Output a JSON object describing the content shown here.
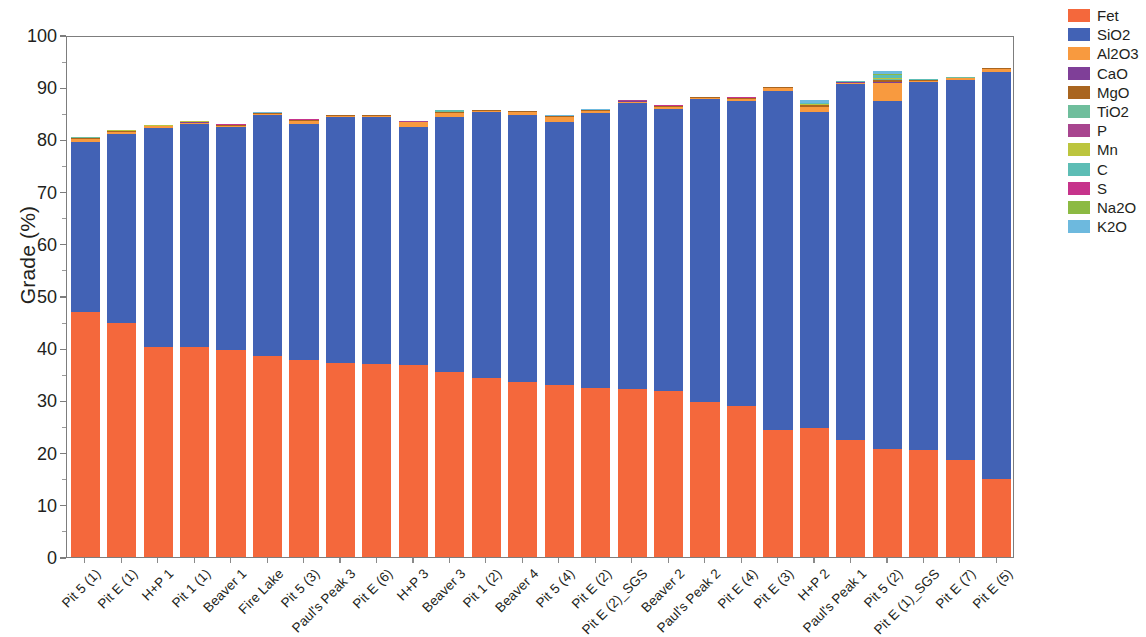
{
  "chart_data": {
    "type": "bar",
    "subtype": "stacked-bar",
    "title": "",
    "xlabel": "",
    "ylabel": "Grade (%)",
    "ylim": [
      0,
      100
    ],
    "ytick_step": 10,
    "yticks": [
      "0",
      "10",
      "20",
      "30",
      "40",
      "50",
      "60",
      "70",
      "80",
      "90",
      "100"
    ],
    "grid": false,
    "legend_position": "right",
    "categories": [
      "Pit 5 (1)",
      "Pit E (1)",
      "H+P 1",
      "Pit 1 (1)",
      "Beaver 1",
      "Fire Lake",
      "Pit 5 (3)",
      "Paul's Peak 3",
      "Pit E (6)",
      "H+P 3",
      "Beaver 3",
      "Pit 1 (2)",
      "Beaver 4",
      "Pit 5 (4)",
      "Pit E (2)",
      "Pit E (2)_SGS",
      "Beaver 2",
      "Paul's Peak 2",
      "Pit E (4)",
      "Pit E (3)",
      "H+P 2",
      "Paul's Peak 1",
      "Pit 5 (2)",
      "Pit E (1)_SGS",
      "Pit E (7)",
      "Pit E (5)"
    ],
    "series": [
      {
        "name": "Fet",
        "color": "#F4683C",
        "values": [
          46.9,
          44.8,
          40.2,
          40.2,
          39.6,
          38.6,
          37.7,
          37.2,
          37.0,
          36.8,
          35.4,
          34.2,
          33.6,
          33.0,
          32.4,
          32.2,
          31.8,
          29.7,
          28.9,
          24.4,
          24.7,
          22.4,
          20.7,
          20.5,
          18.6,
          14.9
        ]
      },
      {
        "name": "SiO2",
        "color": "#4262B5",
        "values": [
          32.6,
          36.2,
          42.0,
          42.8,
          42.8,
          46.1,
          45.2,
          47.1,
          47.3,
          45.6,
          48.8,
          51.0,
          51.0,
          50.4,
          52.7,
          54.7,
          54.0,
          58.0,
          58.5,
          64.9,
          60.6,
          68.3,
          66.6,
          70.5,
          72.7,
          78.1
        ]
      },
      {
        "name": "Al2O3",
        "color": "#F89A3F",
        "values": [
          0.55,
          0.4,
          0.28,
          0.22,
          0.22,
          0.2,
          0.65,
          0.18,
          0.2,
          0.86,
          0.8,
          0.22,
          0.6,
          0.9,
          0.35,
          0.35,
          0.45,
          0.25,
          0.4,
          0.55,
          0.9,
          0.2,
          3.6,
          0.25,
          0.4,
          0.45
        ]
      },
      {
        "name": "CaO",
        "color": "#7F3F98",
        "values": [
          0.03,
          0.03,
          0.03,
          0.03,
          0.03,
          0.03,
          0.03,
          0.03,
          0.03,
          0.03,
          0.03,
          0.03,
          0.03,
          0.03,
          0.03,
          0.03,
          0.03,
          0.03,
          0.03,
          0.03,
          0.03,
          0.03,
          0.05,
          0.03,
          0.03,
          0.03
        ]
      },
      {
        "name": "MgO",
        "color": "#A9651F",
        "values": [
          0.28,
          0.22,
          0.12,
          0.12,
          0.12,
          0.1,
          0.15,
          0.1,
          0.1,
          0.12,
          0.2,
          0.1,
          0.12,
          0.12,
          0.12,
          0.15,
          0.12,
          0.1,
          0.12,
          0.12,
          0.3,
          0.1,
          0.35,
          0.12,
          0.12,
          0.12
        ]
      },
      {
        "name": "TiO2",
        "color": "#6FBE9C",
        "values": [
          0.02,
          0.02,
          0.02,
          0.02,
          0.02,
          0.02,
          0.02,
          0.02,
          0.02,
          0.02,
          0.25,
          0.02,
          0.02,
          0.02,
          0.02,
          0.02,
          0.02,
          0.02,
          0.02,
          0.02,
          0.12,
          0.02,
          0.3,
          0.02,
          0.02,
          0.02
        ]
      },
      {
        "name": "P",
        "color": "#A8458F",
        "values": [
          0.02,
          0.02,
          0.02,
          0.02,
          0.02,
          0.02,
          0.02,
          0.02,
          0.02,
          0.02,
          0.02,
          0.02,
          0.02,
          0.02,
          0.02,
          0.02,
          0.02,
          0.02,
          0.02,
          0.02,
          0.02,
          0.02,
          0.03,
          0.02,
          0.02,
          0.02
        ]
      },
      {
        "name": "Mn",
        "color": "#BCC53E",
        "values": [
          0.04,
          0.04,
          0.03,
          0.03,
          0.03,
          0.03,
          0.03,
          0.03,
          0.03,
          0.03,
          0.03,
          0.03,
          0.03,
          0.03,
          0.03,
          0.03,
          0.03,
          0.03,
          0.03,
          0.03,
          0.12,
          0.03,
          0.2,
          0.03,
          0.03,
          0.03
        ]
      },
      {
        "name": "C",
        "color": "#5DBDB5",
        "values": [
          0.03,
          0.03,
          0.02,
          0.02,
          0.02,
          0.02,
          0.02,
          0.02,
          0.02,
          0.02,
          0.02,
          0.02,
          0.02,
          0.02,
          0.02,
          0.02,
          0.02,
          0.02,
          0.02,
          0.02,
          0.25,
          0.02,
          0.55,
          0.02,
          0.02,
          0.02
        ]
      },
      {
        "name": "S",
        "color": "#C6338B",
        "values": [
          0.02,
          0.02,
          0.02,
          0.02,
          0.02,
          0.02,
          0.02,
          0.02,
          0.02,
          0.02,
          0.02,
          0.02,
          0.02,
          0.02,
          0.02,
          0.02,
          0.02,
          0.02,
          0.02,
          0.02,
          0.02,
          0.02,
          0.03,
          0.02,
          0.02,
          0.02
        ]
      },
      {
        "name": "Na2O",
        "color": "#8CBA43",
        "values": [
          0.02,
          0.02,
          0.02,
          0.02,
          0.02,
          0.02,
          0.02,
          0.02,
          0.02,
          0.02,
          0.02,
          0.02,
          0.02,
          0.02,
          0.02,
          0.02,
          0.02,
          0.02,
          0.02,
          0.02,
          0.02,
          0.02,
          0.1,
          0.02,
          0.02,
          0.02
        ]
      },
      {
        "name": "K2O",
        "color": "#6DB9DE",
        "values": [
          0.02,
          0.02,
          0.02,
          0.02,
          0.02,
          0.02,
          0.02,
          0.02,
          0.02,
          0.02,
          0.02,
          0.02,
          0.02,
          0.02,
          0.02,
          0.02,
          0.02,
          0.02,
          0.02,
          0.02,
          0.4,
          0.02,
          0.7,
          0.02,
          0.02,
          0.02
        ]
      }
    ],
    "bar_totals": [
      80.5,
      81.8,
      82.8,
      83.5,
      82.9,
      85.1,
      83.9,
      84.8,
      84.8,
      83.5,
      85.6,
      85.7,
      85.5,
      84.6,
      85.7,
      87.5,
      86.5,
      88.2,
      88.1,
      90.1,
      87.5,
      91.2,
      92.5,
      91.5,
      92.0,
      93.7
    ]
  },
  "legend": {
    "items": [
      {
        "label": "Fet",
        "color": "#F4683C"
      },
      {
        "label": "SiO2",
        "color": "#4262B5"
      },
      {
        "label": "Al2O3",
        "color": "#F89A3F"
      },
      {
        "label": "CaO",
        "color": "#7F3F98"
      },
      {
        "label": "MgO",
        "color": "#A9651F"
      },
      {
        "label": "TiO2",
        "color": "#6FBE9C"
      },
      {
        "label": "P",
        "color": "#A8458F"
      },
      {
        "label": "Mn",
        "color": "#BCC53E"
      },
      {
        "label": "C",
        "color": "#5DBDB5"
      },
      {
        "label": "S",
        "color": "#C6338B"
      },
      {
        "label": "Na2O",
        "color": "#8CBA43"
      },
      {
        "label": "K2O",
        "color": "#6DB9DE"
      }
    ]
  }
}
